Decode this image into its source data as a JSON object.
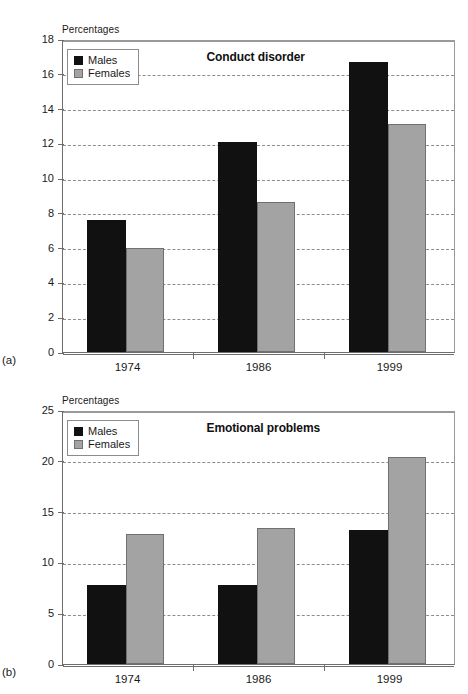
{
  "figure": {
    "panels": [
      {
        "tag": "(a)",
        "title": "Conduct disorder",
        "axis_title": "Percentages"
      },
      {
        "tag": "(b)",
        "title": "Emotional problems",
        "axis_title": "Percentages"
      }
    ],
    "legend": {
      "males_label": "Males",
      "females_label": "Females"
    },
    "colors": {
      "males": "#111111",
      "females": "#a3a3a3",
      "gridline": "#8d8d8d",
      "axis": "#6e6e6e",
      "background": "#ffffff"
    }
  },
  "chart_data": [
    {
      "type": "bar",
      "title": "Conduct disorder",
      "panel": "(a)",
      "xlabel": "",
      "ylabel": "Percentages",
      "categories": [
        "1974",
        "1986",
        "1999"
      ],
      "series": [
        {
          "name": "Males",
          "values": [
            7.6,
            12.1,
            16.7
          ]
        },
        {
          "name": "Females",
          "values": [
            6.0,
            8.6,
            13.1
          ]
        }
      ],
      "ylim": [
        0,
        18
      ],
      "yticks": [
        0,
        2,
        4,
        6,
        8,
        10,
        12,
        14,
        16,
        18
      ],
      "grid": true,
      "legend_position": "top-left"
    },
    {
      "type": "bar",
      "title": "Emotional problems",
      "panel": "(b)",
      "xlabel": "",
      "ylabel": "Percentages",
      "categories": [
        "1974",
        "1986",
        "1999"
      ],
      "series": [
        {
          "name": "Males",
          "values": [
            7.8,
            7.8,
            13.2
          ]
        },
        {
          "name": "Females",
          "values": [
            12.8,
            13.4,
            20.4
          ]
        }
      ],
      "ylim": [
        0,
        25
      ],
      "yticks": [
        0,
        5,
        10,
        15,
        20,
        25
      ],
      "grid": true,
      "legend_position": "top-left"
    }
  ]
}
